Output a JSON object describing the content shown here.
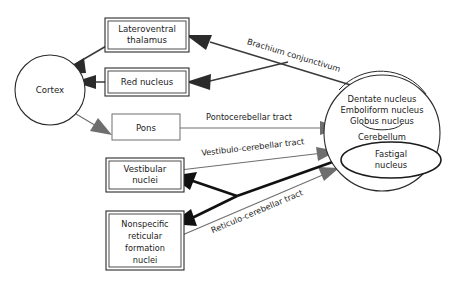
{
  "diagram": {
    "nodes": {
      "cortex": {
        "label": "Cortex",
        "shape": "circle"
      },
      "lateroventral_thalamus": {
        "line1": "Lateroventral",
        "line2": "thalamus",
        "shape": "box"
      },
      "red_nucleus": {
        "label": "Red nucleus",
        "shape": "box"
      },
      "pons": {
        "label": "Pons",
        "shape": "box"
      },
      "vestibular_nuclei": {
        "line1": "Vestibular",
        "line2": "nuclei",
        "shape": "box"
      },
      "nonspecific_reticular": {
        "line1": "Nonspecific",
        "line2": "reticular",
        "line3": "formation",
        "line4": "nuclei",
        "shape": "box"
      },
      "cerebellum": {
        "label": "Cerebellum",
        "shape": "circle",
        "deep_nuclei": [
          "Dentate nucleus",
          "Emboliform nucleus",
          "Globus nucleus"
        ],
        "fastigal": {
          "line1": "Fastigal",
          "line2": "nucleus",
          "shape": "ellipse"
        }
      }
    },
    "tracts": {
      "brachium_conjunctivum": "Brachium conjunctivum",
      "pontocerebellar": "Pontocerebellar tract",
      "vestibulocerebellar": "Vestibulo-cerebellar tract",
      "reticulocerebellar": "Reticulo-cerebellar tract"
    },
    "colors": {
      "ink": "#1b1b1b",
      "line_dark": "#2b2b2b",
      "line_gray": "#6e6e6e",
      "background": "#ffffff"
    }
  }
}
